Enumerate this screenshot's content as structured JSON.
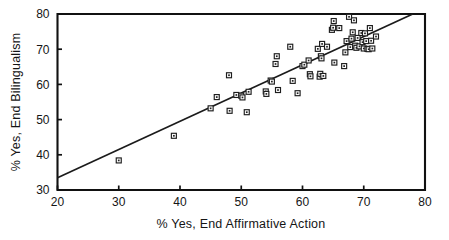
{
  "chart_data": {
    "type": "scatter",
    "title": "",
    "xlabel": "% Yes, End Affirmative Action",
    "ylabel": "% Yes, End Bilingualism",
    "xlim": [
      20,
      80
    ],
    "ylim": [
      30,
      80
    ],
    "xticks": [
      20,
      30,
      40,
      50,
      60,
      70,
      80
    ],
    "yticks": [
      30,
      40,
      50,
      60,
      70,
      80
    ],
    "xtick_labels": [
      "20",
      "30",
      "40",
      "50",
      "60",
      "70",
      "80"
    ],
    "ytick_labels": [
      "30",
      "40",
      "50",
      "60",
      "70",
      "80"
    ],
    "grid": false,
    "legend": false,
    "legend_position": "none",
    "marker": "open-square",
    "marker_color": "#1d1d1d",
    "line_color": "#1b1b1b",
    "background_color": "#ffffff",
    "trend_line": {
      "type": "linear-fit",
      "x_start": 20,
      "y_start": 33.5,
      "x_end": 78,
      "y_end": 80.0
    },
    "points": [
      {
        "x": 30.0,
        "y": 38.4
      },
      {
        "x": 39.0,
        "y": 45.4
      },
      {
        "x": 45.0,
        "y": 53.2
      },
      {
        "x": 46.0,
        "y": 56.4
      },
      {
        "x": 48.0,
        "y": 62.6
      },
      {
        "x": 48.1,
        "y": 52.5
      },
      {
        "x": 49.2,
        "y": 57.0
      },
      {
        "x": 50.0,
        "y": 56.8
      },
      {
        "x": 50.2,
        "y": 56.3
      },
      {
        "x": 50.9,
        "y": 52.1
      },
      {
        "x": 51.2,
        "y": 57.9
      },
      {
        "x": 54.0,
        "y": 58.0
      },
      {
        "x": 54.1,
        "y": 57.3
      },
      {
        "x": 54.8,
        "y": 61.1
      },
      {
        "x": 55.0,
        "y": 60.8
      },
      {
        "x": 55.6,
        "y": 65.8
      },
      {
        "x": 55.8,
        "y": 68.0
      },
      {
        "x": 56.0,
        "y": 58.4
      },
      {
        "x": 58.0,
        "y": 70.7
      },
      {
        "x": 58.4,
        "y": 61.0
      },
      {
        "x": 59.2,
        "y": 57.5
      },
      {
        "x": 60.0,
        "y": 65.2
      },
      {
        "x": 60.3,
        "y": 65.6
      },
      {
        "x": 61.0,
        "y": 66.8
      },
      {
        "x": 61.2,
        "y": 62.9
      },
      {
        "x": 61.3,
        "y": 62.3
      },
      {
        "x": 62.5,
        "y": 70.1
      },
      {
        "x": 62.8,
        "y": 62.2
      },
      {
        "x": 62.9,
        "y": 63.0
      },
      {
        "x": 63.0,
        "y": 68.0
      },
      {
        "x": 63.1,
        "y": 67.4
      },
      {
        "x": 63.2,
        "y": 71.5
      },
      {
        "x": 63.4,
        "y": 62.4
      },
      {
        "x": 64.0,
        "y": 70.7
      },
      {
        "x": 64.8,
        "y": 75.5
      },
      {
        "x": 65.0,
        "y": 76.1
      },
      {
        "x": 65.1,
        "y": 78.0
      },
      {
        "x": 65.2,
        "y": 66.2
      },
      {
        "x": 66.0,
        "y": 76.0
      },
      {
        "x": 66.8,
        "y": 65.2
      },
      {
        "x": 67.0,
        "y": 69.1
      },
      {
        "x": 67.2,
        "y": 72.3
      },
      {
        "x": 67.6,
        "y": 79.2
      },
      {
        "x": 67.8,
        "y": 70.6
      },
      {
        "x": 68.0,
        "y": 73.0
      },
      {
        "x": 68.2,
        "y": 74.8
      },
      {
        "x": 68.4,
        "y": 78.2
      },
      {
        "x": 68.6,
        "y": 71.0
      },
      {
        "x": 68.8,
        "y": 70.4
      },
      {
        "x": 69.0,
        "y": 73.2
      },
      {
        "x": 69.3,
        "y": 70.8
      },
      {
        "x": 69.6,
        "y": 74.6
      },
      {
        "x": 69.8,
        "y": 72.0
      },
      {
        "x": 70.0,
        "y": 70.2
      },
      {
        "x": 70.2,
        "y": 74.5
      },
      {
        "x": 70.4,
        "y": 72.3
      },
      {
        "x": 70.6,
        "y": 70.1
      },
      {
        "x": 70.8,
        "y": 70.0
      },
      {
        "x": 71.0,
        "y": 76.0
      },
      {
        "x": 71.2,
        "y": 72.4
      },
      {
        "x": 71.4,
        "y": 70.2
      },
      {
        "x": 72.0,
        "y": 73.6
      }
    ]
  }
}
